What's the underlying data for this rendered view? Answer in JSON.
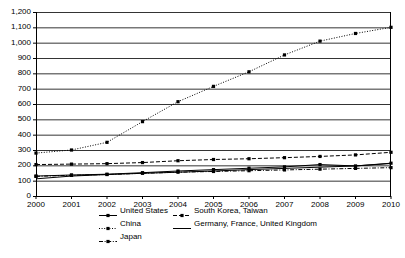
{
  "chart_data": {
    "type": "line",
    "title": "",
    "subtitle": "",
    "xlabel": "",
    "ylabel": "",
    "grid": true,
    "legend_position": "bottom",
    "x": [
      2000,
      2001,
      2002,
      2003,
      2004,
      2005,
      2006,
      2007,
      2008,
      2009,
      2010
    ],
    "categories": [
      "2000",
      "2001",
      "2002",
      "2003",
      "2004",
      "2005",
      "2006",
      "2007",
      "2008",
      "2009",
      "2010"
    ],
    "xlim": [
      2000,
      2010
    ],
    "ylim": [
      0,
      1200
    ],
    "ytick_labels": [
      "0",
      "100",
      "200",
      "300",
      "400",
      "500",
      "600",
      "700",
      "800",
      "900",
      "1,000",
      "1,100",
      "1,200"
    ],
    "ytick_values": [
      0,
      100,
      200,
      300,
      400,
      500,
      600,
      700,
      800,
      900,
      1000,
      1100,
      1200
    ],
    "series": [
      {
        "name": "United States",
        "style": "solid-marker",
        "color": "#000000",
        "values": [
          130,
          137,
          142,
          152,
          163,
          172,
          181,
          190,
          205,
          196,
          214
        ]
      },
      {
        "name": "South Korea, Taiwan",
        "style": "dashed-marker",
        "color": "#000000",
        "values": [
          205,
          208,
          211,
          218,
          230,
          238,
          243,
          250,
          258,
          268,
          285
        ]
      },
      {
        "name": "China",
        "style": "dotted-marker",
        "color": "#000000",
        "values": [
          280,
          300,
          350,
          485,
          615,
          715,
          810,
          920,
          1010,
          1060,
          1100
        ]
      },
      {
        "name": "Germany, France, United Kingdom",
        "style": "solid-plain",
        "color": "#000000",
        "values": [
          112,
          130,
          140,
          148,
          155,
          163,
          172,
          180,
          188,
          196,
          212
        ]
      },
      {
        "name": "Japan",
        "style": "dashdot-marker",
        "color": "#000000",
        "values": [
          128,
          135,
          140,
          148,
          155,
          160,
          165,
          170,
          175,
          180,
          185
        ]
      }
    ]
  },
  "legend": {
    "items": [
      {
        "label": "United States",
        "marker": "line-marker-solid-icon"
      },
      {
        "label": "South Korea, Taiwan",
        "marker": "line-marker-dashed-icon"
      },
      {
        "label": "China",
        "marker": "line-marker-dotted-icon"
      },
      {
        "label": "Germany, France, United Kingdom",
        "marker": "line-plain-solid-icon"
      },
      {
        "label": "Japan",
        "marker": "line-marker-dashdot-icon"
      }
    ]
  }
}
